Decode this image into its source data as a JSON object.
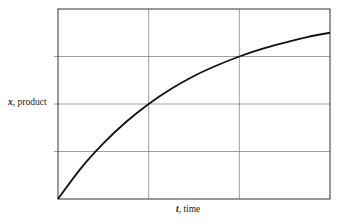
{
  "chart_data": {
    "type": "line",
    "title": "",
    "xlabel": "t, time",
    "ylabel": "x, product",
    "xlabel_var": "t",
    "xlabel_rest": ", time",
    "ylabel_var": "x",
    "ylabel_rest": ", product",
    "grid": true,
    "x_grid_divisions": 3,
    "y_grid_divisions": 4,
    "xlim": [
      0,
      3
    ],
    "ylim": [
      0,
      4
    ],
    "tick_labels": false,
    "legend": null,
    "series": [
      {
        "name": "x(t)",
        "description": "saturating exponential growth, x = 4(1 - 0.5^t)",
        "x": [
          0,
          0.25,
          0.5,
          0.75,
          1.0,
          1.25,
          1.5,
          1.75,
          2.0,
          2.25,
          2.5,
          2.75,
          3.0
        ],
        "values": [
          0,
          0.64,
          1.17,
          1.62,
          2.0,
          2.32,
          2.59,
          2.81,
          3.0,
          3.16,
          3.29,
          3.41,
          3.5
        ]
      }
    ],
    "colors": {
      "line": "#111111",
      "grid": "#888888",
      "frame": "#333333"
    }
  }
}
